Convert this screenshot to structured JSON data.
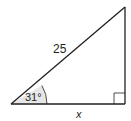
{
  "diagram": {
    "type": "right-triangle",
    "hypotenuse_label": "25",
    "angle_label": "31°",
    "base_label": "x",
    "right_angle_marker": true,
    "colors": {
      "stroke": "#231f20",
      "angle_fill": "#e6e6e6",
      "background": "#ffffff"
    }
  }
}
